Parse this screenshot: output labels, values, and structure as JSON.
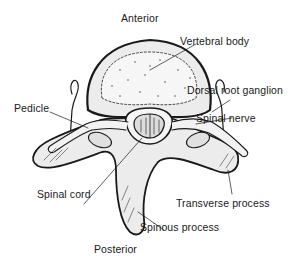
{
  "diagram": {
    "orientation": {
      "top": "Anterior",
      "bottom": "Posterior"
    },
    "labels": [
      {
        "id": "vertebral-body",
        "text": "Vertebral body"
      },
      {
        "id": "dorsal-root-ganglion",
        "text": "Dorsal root ganglion"
      },
      {
        "id": "spinal-nerve",
        "text": "Spinal nerve"
      },
      {
        "id": "pedicle",
        "text": "Pedicle"
      },
      {
        "id": "spinal-cord",
        "text": "Spinal cord"
      },
      {
        "id": "transverse-process",
        "text": "Transverse process"
      },
      {
        "id": "spinous-process",
        "text": "Spinous process"
      }
    ],
    "colors": {
      "line": "#1a1a1a",
      "bone_fill": "#e9e9e9",
      "body_fill": "#f4f4f4",
      "background": "#ffffff"
    }
  }
}
